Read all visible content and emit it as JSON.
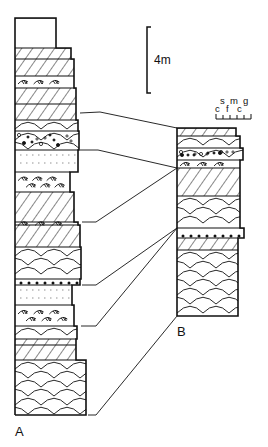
{
  "figure": {
    "type": "stratigraphic-correlation",
    "scale_bar": {
      "label": "4m"
    },
    "grain_scale": {
      "top_labels": [
        "s",
        "m",
        "g"
      ],
      "bottom_labels": [
        "c",
        "f",
        "c"
      ]
    },
    "sections": [
      {
        "id": "A",
        "label": "A",
        "beds_top_to_bottom": [
          "blank",
          "cross-hatched",
          "cross-hatched",
          "ripple",
          "cross-hatched",
          "cross-hatched",
          "trough-scallop",
          "pebbly-scallop",
          "fine-dotted",
          "ripple",
          "cross-hatched",
          "ripple",
          "cross-hatched",
          "trough-scallop",
          "pebbly-base",
          "fine-dotted",
          "ripple",
          "trough-scallop",
          "cross-hatched",
          "cross-hatched",
          "trough-scallop"
        ]
      },
      {
        "id": "B",
        "label": "B",
        "beds_top_to_bottom": [
          "cross-hatched",
          "trough-scallop",
          "pebbly-scallop",
          "ripple",
          "cross-hatched",
          "trough-scallop",
          "pebbly-base",
          "cross-hatched",
          "trough-scallop"
        ]
      }
    ],
    "correlation_lines": 6
  }
}
